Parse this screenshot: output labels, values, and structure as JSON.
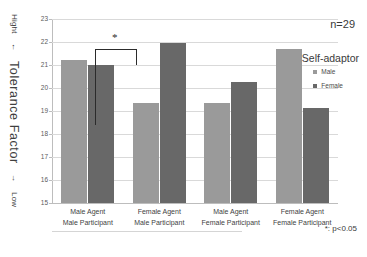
{
  "chart_data": {
    "type": "bar",
    "title": "",
    "categories": [
      "Male Agent / Male Participant",
      "Female Agent / Male Participant",
      "Male Agent / Female Participant",
      "Female Agent / Female Participant"
    ],
    "category_lines": [
      {
        "line1": "Male Agent",
        "line2": "Male Participant"
      },
      {
        "line1": "Female Agent",
        "line2": "Male Participant"
      },
      {
        "line1": "Male Agent",
        "line2": "Female Participant"
      },
      {
        "line1": "Female Agent",
        "line2": "Female Participant"
      }
    ],
    "series": [
      {
        "name": "Male",
        "color": "#9a9a9a",
        "values": [
          21.2,
          19.35,
          19.35,
          21.7
        ]
      },
      {
        "name": "Female",
        "color": "#686868",
        "values": [
          21.0,
          21.95,
          20.25,
          19.15
        ]
      }
    ],
    "ylabel": "Tolerance Factor",
    "ylabel_high": "Hight",
    "ylabel_high_arrow": "←",
    "ylabel_low": "Low",
    "ylabel_low_arrow": "→",
    "xlabel": "",
    "ylim": [
      15,
      23
    ],
    "yticks": [
      15,
      16,
      17,
      18,
      19,
      20,
      21,
      22,
      23
    ],
    "grid": true,
    "legend_position": "right",
    "legend_title": "Self-adaptor",
    "annotations": {
      "sample_size": "n=29",
      "significance_marker": "*",
      "significance_note": "*: p<0.05",
      "significance_between": [
        "Female Agent / Male Participant - Male",
        "Female Agent / Male Participant - Female"
      ]
    }
  },
  "colors": {
    "male": "#9a9a9a",
    "female": "#686868",
    "grid": "#d9d9d9",
    "axis": "#bdbdbd",
    "text": "#3a3a3a"
  }
}
